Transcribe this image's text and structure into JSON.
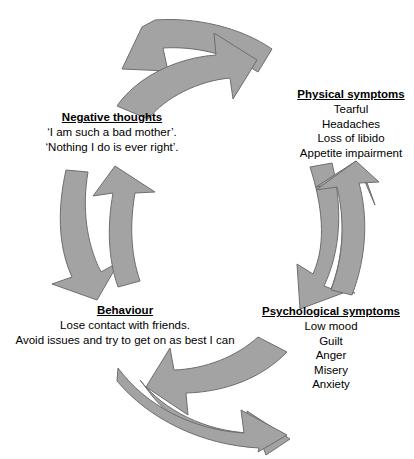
{
  "diagram": {
    "type": "cyclical-flow",
    "arrow_fill": "#a3a3a3",
    "arrow_stroke": "#6e6e6e",
    "background": "#ffffff",
    "nodes": [
      {
        "id": "negative-thoughts",
        "title": "Negative thoughts",
        "lines": [
          "‘I am such a bad mother’.",
          "‘Nothing I do is ever right’."
        ]
      },
      {
        "id": "physical-symptoms",
        "title": "Physical symptoms",
        "lines": [
          "Tearful",
          "Headaches",
          "Loss of libido",
          "Appetite impairment"
        ]
      },
      {
        "id": "psychological-symptoms",
        "title": "Psychological symptoms",
        "lines": [
          "Low mood",
          "Guilt",
          "Anger",
          "Misery",
          "Anxiety"
        ]
      },
      {
        "id": "behaviour",
        "title": "Behaviour",
        "lines": [
          "Lose contact with friends.",
          "Avoid issues and try to get on as best I can"
        ]
      }
    ],
    "arrows": [
      {
        "id": "top-left-pointing",
        "from": "physical-symptoms",
        "to": "negative-thoughts",
        "direction": "left"
      },
      {
        "id": "top-right-pointing",
        "from": "negative-thoughts",
        "to": "physical-symptoms",
        "direction": "right"
      },
      {
        "id": "right-down-pointing",
        "from": "physical-symptoms",
        "to": "psychological-symptoms",
        "direction": "down"
      },
      {
        "id": "right-up-pointing",
        "from": "psychological-symptoms",
        "to": "physical-symptoms",
        "direction": "up"
      },
      {
        "id": "bottom-left-pointing",
        "from": "psychological-symptoms",
        "to": "behaviour",
        "direction": "left"
      },
      {
        "id": "bottom-right-pointing",
        "from": "behaviour",
        "to": "psychological-symptoms",
        "direction": "right"
      },
      {
        "id": "left-down-pointing",
        "from": "negative-thoughts",
        "to": "behaviour",
        "direction": "down"
      },
      {
        "id": "left-up-pointing",
        "from": "behaviour",
        "to": "negative-thoughts",
        "direction": "up"
      }
    ]
  }
}
